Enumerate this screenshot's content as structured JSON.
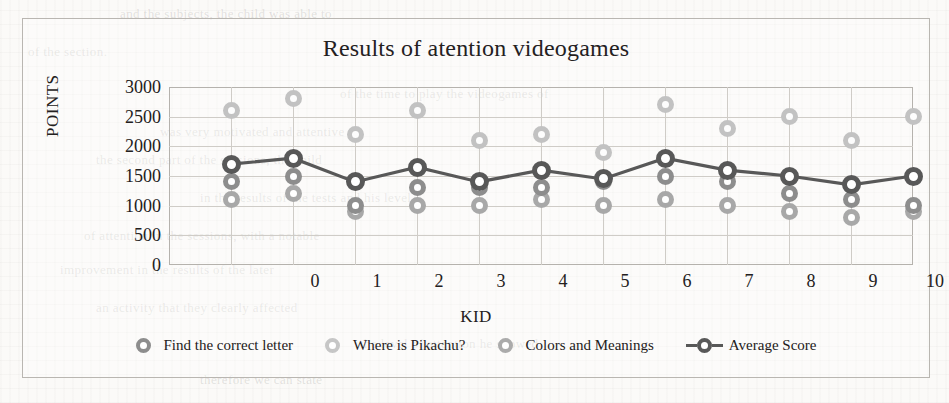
{
  "chart_data": {
    "type": "scatter",
    "title": "Results of atention videogames",
    "xlabel": "KID",
    "ylabel": "POINTS",
    "xlim": [
      0,
      12
    ],
    "ylim": [
      0,
      3000
    ],
    "ytick_step": 500,
    "xticks": [
      "0",
      "1",
      "2",
      "3",
      "4",
      "5",
      "6",
      "7",
      "8",
      "9",
      "10",
      "11",
      "12"
    ],
    "yticks": [
      "0",
      "500",
      "1000",
      "1500",
      "2000",
      "2500",
      "3000"
    ],
    "grid": true,
    "legend_position": "bottom",
    "categories": [
      1,
      2,
      3,
      4,
      5,
      6,
      7,
      8,
      9,
      10,
      11,
      12
    ],
    "series": [
      {
        "name": "Find the correct letter",
        "marker": "circle",
        "color": "#8d8d8d",
        "values": [
          1400,
          1500,
          1000,
          1300,
          1300,
          1300,
          1400,
          1500,
          1400,
          1200,
          1100,
          1000
        ]
      },
      {
        "name": "Where is Pikachu?",
        "marker": "circle",
        "color": "#c2c2c2",
        "values": [
          2600,
          2800,
          2200,
          2600,
          2100,
          2200,
          1900,
          2700,
          2300,
          2500,
          2100,
          2500
        ]
      },
      {
        "name": "Colors and Meanings",
        "marker": "circle",
        "color": "#a8a8a8",
        "values": [
          1100,
          1200,
          900,
          1000,
          1000,
          1100,
          1000,
          1100,
          1000,
          900,
          800,
          900
        ]
      },
      {
        "name": "Average Score",
        "marker": "circle-line",
        "color": "#585858",
        "values": [
          1700,
          1800,
          1400,
          1650,
          1400,
          1600,
          1450,
          1800,
          1600,
          1500,
          1350,
          1500
        ]
      }
    ]
  },
  "legend": {
    "items": [
      {
        "label": "Find the correct letter",
        "style": "lm0"
      },
      {
        "label": "Where is Pikachu?",
        "style": "lm1"
      },
      {
        "label": "Colors and Meanings",
        "style": "lm2"
      },
      {
        "label": "Average Score",
        "style": "line"
      }
    ]
  },
  "background_bleed": [
    {
      "text": "and the subjects, the child was able to",
      "x": 120,
      "y": 6
    },
    {
      "text": "of the section.",
      "x": 28,
      "y": 44
    },
    {
      "text": "of the time to play the videogames of",
      "x": 340,
      "y": 86
    },
    {
      "text": "was very motivated and attentive",
      "x": 160,
      "y": 124
    },
    {
      "text": "the second part of the sessions, the child",
      "x": 96,
      "y": 152
    },
    {
      "text": "in the results of the tests and his level",
      "x": 200,
      "y": 190
    },
    {
      "text": "of attention in the sessions, with a notable",
      "x": 84,
      "y": 228
    },
    {
      "text": "improvement in the results of the later",
      "x": 60,
      "y": 262
    },
    {
      "text": "an activity that they clearly affected",
      "x": 96,
      "y": 300
    },
    {
      "text": "the level of attention he showed",
      "x": 360,
      "y": 336
    },
    {
      "text": "therefore we can state",
      "x": 200,
      "y": 372
    }
  ]
}
